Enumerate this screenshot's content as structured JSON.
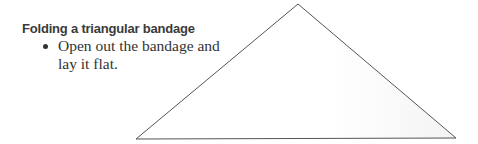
{
  "heading": "Folding a triangular bandage",
  "steps": [
    {
      "text": "Open out the bandage and lay it flat."
    }
  ],
  "figure": {
    "shape": "triangle",
    "stroke_color": "#555555",
    "fill_color": "#fdfdfd",
    "points": [
      [
        298,
        4
      ],
      [
        136,
        139
      ],
      [
        456,
        138
      ]
    ]
  }
}
